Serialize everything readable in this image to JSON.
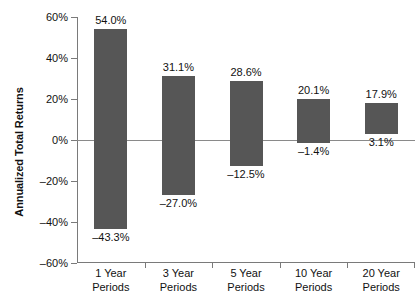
{
  "chart_data": {
    "type": "bar",
    "subtype": "floating-range-bar",
    "title": "",
    "xlabel": "",
    "ylabel": "Annualized Total Returns",
    "ylim": [
      -60,
      60
    ],
    "ytick_values": [
      60,
      40,
      20,
      0,
      -20,
      -40,
      -60
    ],
    "ytick_labels": [
      "60%",
      "40%",
      "20%",
      "0%",
      "–20%",
      "–40%",
      "–60%"
    ],
    "grid": false,
    "legend": null,
    "zero_line": true,
    "categories": [
      "1 Year\nPeriods",
      "3 Year\nPeriods",
      "5 Year\nPeriods",
      "10 Year\nPeriods",
      "20 Year\nPeriods"
    ],
    "category_lines": [
      [
        "1 Year",
        "Periods"
      ],
      [
        "3 Year",
        "Periods"
      ],
      [
        "5 Year",
        "Periods"
      ],
      [
        "10 Year",
        "Periods"
      ],
      [
        "20 Year",
        "Periods"
      ]
    ],
    "series": [
      {
        "name": "Best",
        "values": [
          54.0,
          31.1,
          28.6,
          20.1,
          17.9
        ]
      },
      {
        "name": "Worst",
        "values": [
          -43.3,
          -27.0,
          -12.5,
          -1.4,
          3.1
        ]
      }
    ],
    "bars": [
      {
        "category": "1 Year Periods",
        "high": 54.0,
        "low": -43.3,
        "high_label": "54.0%",
        "low_label": "–43.3%"
      },
      {
        "category": "3 Year Periods",
        "high": 31.1,
        "low": -27.0,
        "high_label": "31.1%",
        "low_label": "–27.0%"
      },
      {
        "category": "5 Year Periods",
        "high": 28.6,
        "low": -12.5,
        "high_label": "28.6%",
        "low_label": "–12.5%"
      },
      {
        "category": "10 Year Periods",
        "high": 20.1,
        "low": -1.4,
        "high_label": "20.1%",
        "low_label": "–1.4%"
      },
      {
        "category": "20 Year Periods",
        "high": 17.9,
        "low": 3.1,
        "high_label": "17.9%",
        "low_label": "3.1%"
      }
    ],
    "colors": {
      "bar_fill": "#565656",
      "axis": "#7a7a7a",
      "zero_line": "#8a8a8a",
      "text": "#111111",
      "background": "#ffffff"
    }
  }
}
